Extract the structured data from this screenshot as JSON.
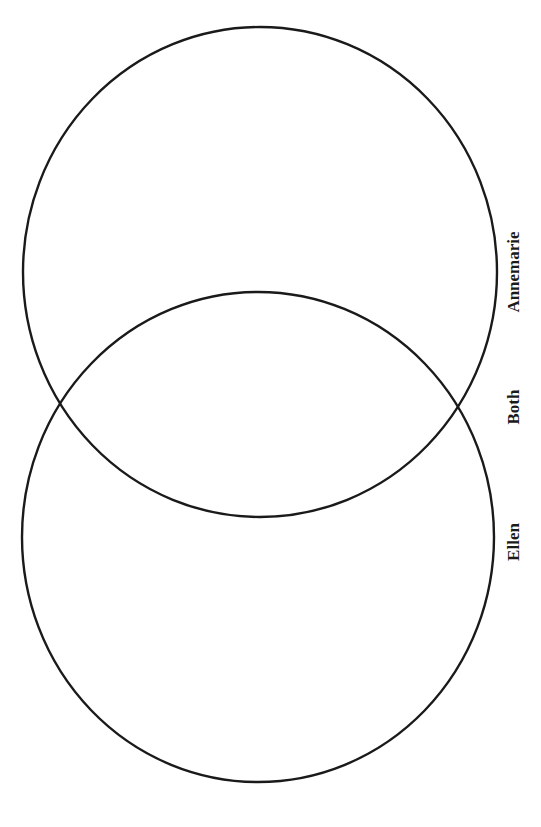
{
  "diagram": {
    "type": "venn",
    "orientation": "vertical, labels rotated 90deg counter-clockwise",
    "sets": [
      {
        "id": "annemarie",
        "label": "Annemarie",
        "shape": {
          "cx": 260,
          "cy": 272,
          "rx": 237,
          "ry": 245
        },
        "label_pos": {
          "x": 519,
          "y": 272
        }
      },
      {
        "id": "ellen",
        "label": "Ellen",
        "shape": {
          "cx": 258,
          "cy": 537,
          "rx": 236,
          "ry": 245
        },
        "label_pos": {
          "x": 519,
          "y": 542
        }
      }
    ],
    "overlap": {
      "id": "both",
      "label": "Both",
      "label_pos": {
        "x": 519,
        "y": 407
      }
    },
    "stroke_color": "#1a1a1a",
    "background_color": "#ffffff"
  }
}
